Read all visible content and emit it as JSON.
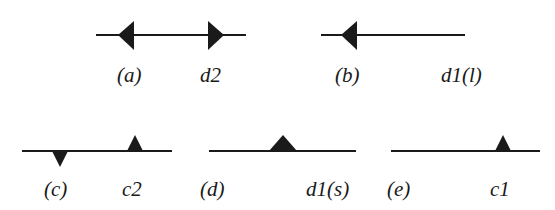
{
  "diagram": {
    "stroke_color": "#1a1a1a",
    "background": "#ffffff",
    "panels": [
      {
        "id": "a",
        "tag": "(a)",
        "name": "d2",
        "description": "horizontal line with two outward-pointing arrowheads"
      },
      {
        "id": "b",
        "tag": "(b)",
        "name": "d1(l)",
        "description": "horizontal line with one left-pointing arrowhead"
      },
      {
        "id": "c",
        "tag": "(c)",
        "name": "c2",
        "description": "horizontal line with one downward and one upward triangle"
      },
      {
        "id": "d",
        "tag": "(d)",
        "name": "d1(s)",
        "description": "horizontal line with one wide upward triangle"
      },
      {
        "id": "e",
        "tag": "(e)",
        "name": "c1",
        "description": "horizontal line with one upward triangle"
      }
    ]
  }
}
